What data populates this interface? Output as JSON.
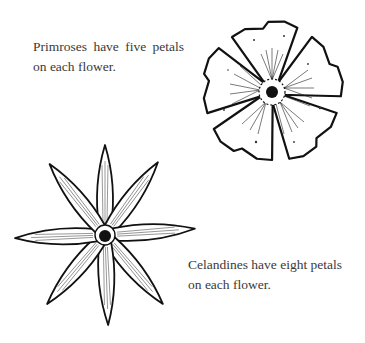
{
  "figures": [
    {
      "id": "primrose",
      "caption_lines": [
        "Primroses have five petals",
        "on each flower."
      ],
      "petal_count": 5,
      "illustration": "primrose-flower-drawing"
    },
    {
      "id": "celandine",
      "caption_lines": [
        "Celandines have eight petals",
        "on each flower."
      ],
      "petal_count": 8,
      "illustration": "celandine-flower-drawing"
    }
  ],
  "colors": {
    "text": "#3a3a3a",
    "ink": "#111111",
    "background": "#ffffff"
  }
}
